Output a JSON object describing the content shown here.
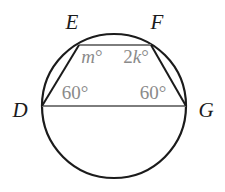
{
  "figure": {
    "type": "circle-geometry-diagram",
    "colors": {
      "circle_stroke": "#1b1b1b",
      "chord_stroke": "#7d7d7d",
      "vertex_label": "#1b1b1b",
      "angle_label": "#8a8a8a",
      "background": "#ffffff"
    },
    "circle": {
      "center_x": 114,
      "center_y": 106,
      "radius": 72
    },
    "vertices": [
      {
        "name": "D",
        "label": "D",
        "x": 42,
        "y": 106,
        "label_x": 20,
        "label_y": 110
      },
      {
        "name": "E",
        "label": "E",
        "x": 79,
        "y": 45,
        "label_x": 72,
        "label_y": 22
      },
      {
        "name": "F",
        "label": "F",
        "x": 151,
        "y": 45,
        "label_x": 157,
        "label_y": 22
      },
      {
        "name": "G",
        "label": "G",
        "x": 186,
        "y": 106,
        "label_x": 206,
        "label_y": 110
      }
    ],
    "segments": [
      {
        "name": "segment-DE",
        "from": "D",
        "to": "E",
        "color": "#1b1b1b"
      },
      {
        "name": "segment-EF",
        "from": "E",
        "to": "F",
        "color": "#7d7d7d"
      },
      {
        "name": "segment-FG",
        "from": "F",
        "to": "G",
        "color": "#1b1b1b"
      },
      {
        "name": "segment-DG",
        "from": "D",
        "to": "G",
        "color": "#7d7d7d"
      }
    ],
    "angles": [
      {
        "name": "angle-at-E",
        "vertex": "E",
        "value": "m",
        "unit": "°",
        "text": "m°",
        "italic_part": "m",
        "plain_part": "",
        "x": 92,
        "y": 56
      },
      {
        "name": "angle-at-F",
        "vertex": "F",
        "value": "2k",
        "unit": "°",
        "text": "2k°",
        "italic_part": "k",
        "plain_part": "2",
        "x": 136,
        "y": 56
      },
      {
        "name": "angle-at-D",
        "vertex": "D",
        "value": "60",
        "unit": "°",
        "text": "60°",
        "italic_part": "",
        "plain_part": "60",
        "x": 75,
        "y": 92
      },
      {
        "name": "angle-at-G",
        "vertex": "G",
        "value": "60",
        "unit": "°",
        "text": "60°",
        "italic_part": "",
        "plain_part": "60",
        "x": 153,
        "y": 92
      }
    ]
  }
}
